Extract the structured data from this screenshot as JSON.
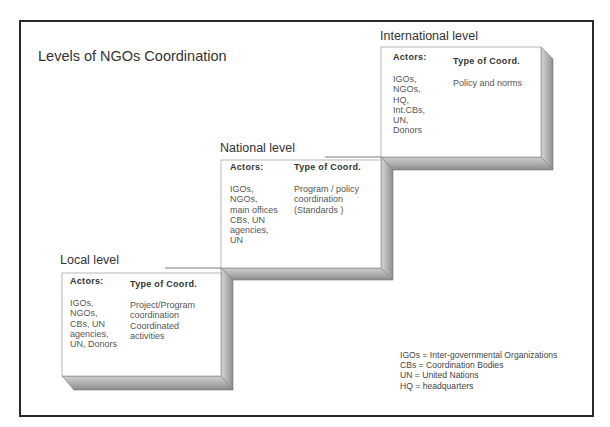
{
  "diagram": {
    "title": "Levels of NGOs Coordination",
    "levels": [
      {
        "name": "International level",
        "actors_heading": "Actors:",
        "type_heading": "Type of Coord.",
        "actors": [
          "IGOs,",
          "NGOs,",
          "HQ,",
          "Int.CBs,",
          "UN,",
          "Donors"
        ],
        "type": [
          "Policy and norms"
        ]
      },
      {
        "name": "National level",
        "actors_heading": "Actors:",
        "type_heading": "Type of Coord.",
        "actors": [
          "IGOs,",
          "NGOs,",
          "main offices",
          "CBs, UN",
          "agencies,",
          "UN"
        ],
        "type": [
          "Program / policy",
          "coordination",
          "(Standards )"
        ]
      },
      {
        "name": "Local level",
        "actors_heading": "Actors:",
        "type_heading": "Type of Coord.",
        "actors": [
          "IGOs,",
          "NGOs,",
          "CBs, UN",
          "agencies,",
          "UN, Donors"
        ],
        "type": [
          "Project/Program",
          "coordination",
          "Coordinated",
          "activities"
        ]
      }
    ],
    "legend": [
      "IGOs = Inter-governmental Organizations",
      "CBs = Coordination Bodies",
      "UN = United Nations",
      "HQ = headquarters"
    ],
    "colors": {
      "frame": "#2a2a2a",
      "bevel_light": "#c8c8c8",
      "bevel_dark": "#9a9a9a",
      "face": "#ffffff"
    }
  }
}
